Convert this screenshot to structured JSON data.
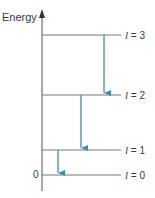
{
  "diagram": {
    "axis_label": "Energy",
    "zero_label": "0",
    "axis_color": "#7a7a7a",
    "level_color": "#777777",
    "arrow_color": "#3a8fb0",
    "levels": [
      {
        "var": "l",
        "eq": " = 3",
        "y": 35
      },
      {
        "var": "l",
        "eq": " = 2",
        "y": 95
      },
      {
        "var": "l",
        "eq": " = 1",
        "y": 150
      },
      {
        "var": "l",
        "eq": " = 0",
        "y": 175
      }
    ],
    "transitions": [
      {
        "from": "l = 3",
        "to": "l = 2",
        "x": 104
      },
      {
        "from": "l = 2",
        "to": "l = 1",
        "x": 81
      },
      {
        "from": "l = 1",
        "to": "l = 0",
        "x": 58
      }
    ]
  }
}
